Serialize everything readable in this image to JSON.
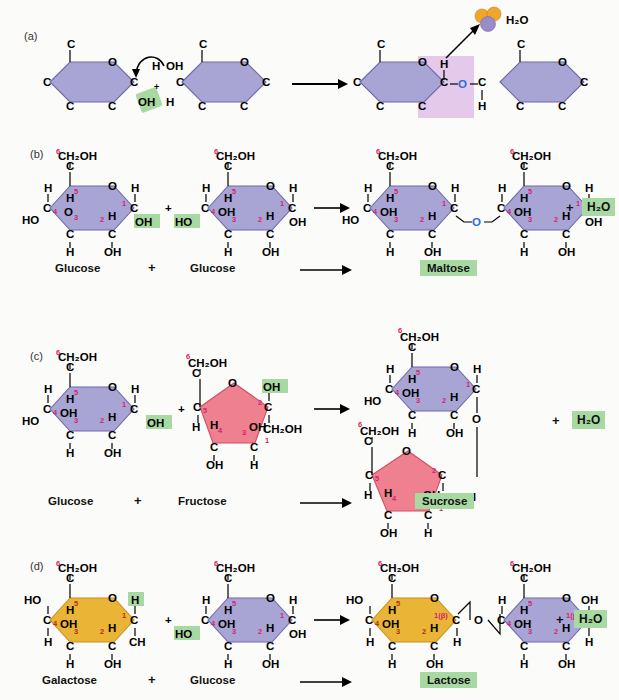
{
  "figure": {
    "background_color": "#fbfbf9"
  },
  "colors": {
    "glucose_ring": "#a8a4d4",
    "glucose_ring_stroke": "#6f68ad",
    "fructose_ring": "#ee8090",
    "fructose_ring_stroke": "#cf4f63",
    "galactose_ring": "#eab537",
    "galactose_ring_stroke": "#c8901c",
    "highlight_green": "#a9d9a2",
    "highlight_pink": "#e4c9ea",
    "glycosidic_oxygen_blue": "#2a6fd6",
    "carbon_number_pink": "#d6246e",
    "carbon_number_orange": "#b03010",
    "water_hydrogen": "#f0a62c",
    "water_oxygen": "#9a8cc8"
  },
  "panels": [
    {
      "id": "a",
      "label": "(a)",
      "description": "Generic condensation reaction mechanism between two sugar rings",
      "reactant_atoms": [
        "C",
        "O",
        "C",
        "C",
        "C",
        "C",
        "H",
        "OH",
        "OH",
        "H",
        "C",
        "O",
        "C",
        "C",
        "C",
        "C"
      ],
      "highlighted_groups": [
        "OH",
        "OH"
      ],
      "plus_sign": "+",
      "arrow": "→",
      "product_atoms": [
        "C",
        "O",
        "C",
        "C",
        "C",
        "C",
        "H",
        "O",
        "H",
        "C",
        "O",
        "C",
        "C",
        "C",
        "C"
      ],
      "water_label": "H₂O",
      "glycosidic_label": "O",
      "has_curved_arrow": true,
      "has_water_spheres": true
    },
    {
      "id": "b",
      "label": "(b)",
      "reactant1": {
        "name": "Glucose",
        "shape": "hexagon",
        "color": "#a8a4d4",
        "top_group": "CH₂OH",
        "carbon_numbers": [
          "6",
          "5",
          "4",
          "3",
          "2",
          "1"
        ],
        "substituents": [
          "H",
          "HO",
          "H",
          "OH",
          "H",
          "OH",
          "H",
          "OH"
        ],
        "reactive_group": "OH"
      },
      "plus_sign": "+",
      "reactant2": {
        "name": "Glucose",
        "shape": "hexagon",
        "color": "#a8a4d4",
        "top_group": "CH₂OH",
        "carbon_numbers": [
          "6",
          "5",
          "4",
          "3",
          "2",
          "1"
        ],
        "reactive_group": "HO"
      },
      "arrow": "→",
      "product": {
        "name": "Maltose",
        "linkage_atom": "O",
        "linkage_color": "#2a6fd6",
        "linkage_from": "1",
        "linkage_to": "4"
      },
      "byproduct": "H₂O",
      "byproduct_plus": "+"
    },
    {
      "id": "c",
      "label": "(c)",
      "reactant1": {
        "name": "Glucose",
        "shape": "hexagon",
        "color": "#a8a4d4",
        "top_group": "CH₂OH",
        "carbon_numbers": [
          "6",
          "5",
          "4",
          "3",
          "2",
          "1"
        ],
        "reactive_group": "OH"
      },
      "plus_sign": "+",
      "reactant2": {
        "name": "Fructose",
        "shape": "pentagon",
        "color": "#ee8090",
        "top_group": "CH₂OH",
        "bottom_group": "CH₂OH",
        "carbon_numbers": [
          "6",
          "5",
          "4",
          "3",
          "2",
          "1"
        ],
        "reactive_group": "OH"
      },
      "arrow": "→",
      "product": {
        "name": "Sucrose",
        "linkage_atom": "O",
        "linkage_color": "#000000",
        "layout": "vertical-stacked",
        "linkage_from": "1",
        "linkage_to": "2"
      },
      "byproduct": "H₂O",
      "byproduct_plus": "+"
    },
    {
      "id": "d",
      "label": "(d)",
      "reactant1": {
        "name": "Galactose",
        "shape": "hexagon",
        "color": "#eab537",
        "top_group": "CH₂OH",
        "carbon_numbers": [
          "6",
          "5",
          "4",
          "3",
          "2",
          "1"
        ],
        "reactive_group": "H"
      },
      "plus_sign": "+",
      "reactant2": {
        "name": "Glucose",
        "shape": "hexagon",
        "color": "#a8a4d4",
        "top_group": "CH₂OH",
        "carbon_numbers": [
          "6",
          "5",
          "4",
          "3",
          "2",
          "1"
        ],
        "reactive_group": "HO"
      },
      "arrow": "→",
      "product": {
        "name": "Lactose",
        "linkage_atom": "O",
        "linkage_color": "#000000",
        "anomeric_labels": [
          "1(β)",
          "1(β)"
        ],
        "linkage_from": "1(β)",
        "linkage_to": "4"
      },
      "byproduct": "H₂O",
      "byproduct_plus": "+"
    }
  ],
  "atoms": {
    "carbon": "C",
    "hydrogen": "H",
    "oxygen": "O",
    "hydroxyl": "OH",
    "hydroxyl_rev": "HO",
    "ch2oh": "CH₂OH",
    "ch": "CH",
    "water": "H₂O"
  }
}
